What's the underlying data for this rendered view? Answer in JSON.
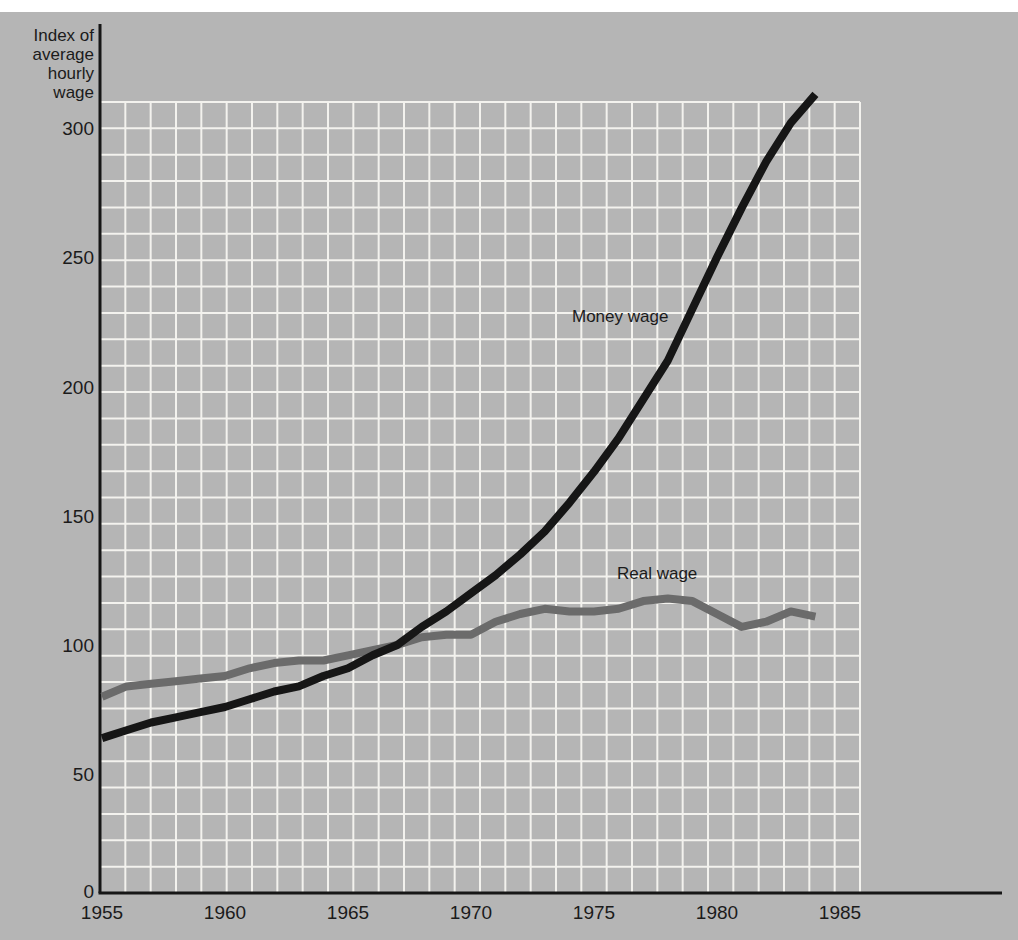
{
  "page": {
    "background_color": "#ffffff",
    "panel_color": "#b5b5b5"
  },
  "chart": {
    "y_axis_title_lines": [
      "Index of",
      "average",
      "hourly",
      "wage"
    ],
    "series_labels": {
      "money": "Money wage",
      "real": "Real wage"
    },
    "colors": {
      "plot_background": "#b5b5b5",
      "grid": "#f3f2ee",
      "axis": "#161616",
      "money_line": "#161616",
      "real_line": "#6b6b6b",
      "text": "#1b1b1b"
    }
  },
  "chart_data": {
    "type": "line",
    "title": "",
    "xlabel": "",
    "ylabel": "Index of average hourly wage",
    "xlim": [
      1955,
      1985
    ],
    "ylim": [
      0,
      320
    ],
    "grid": true,
    "legend_position": "inline-labels",
    "x_ticks": [
      1955,
      1960,
      1965,
      1970,
      1975,
      1980,
      1985
    ],
    "y_ticks": [
      0,
      50,
      100,
      150,
      200,
      250,
      300
    ],
    "x": [
      1955,
      1956,
      1957,
      1958,
      1959,
      1960,
      1961,
      1962,
      1963,
      1964,
      1965,
      1966,
      1967,
      1968,
      1969,
      1970,
      1971,
      1972,
      1973,
      1974,
      1975,
      1976,
      1977,
      1978,
      1979,
      1980,
      1981,
      1982,
      1983,
      1984
    ],
    "series": [
      {
        "name": "Money wage",
        "color": "#161616",
        "values": [
          64,
          67,
          70,
          72,
          74,
          76,
          79,
          82,
          84,
          88,
          91,
          96,
          100,
          107,
          113,
          120,
          127,
          135,
          144,
          155,
          167,
          180,
          195,
          210,
          230,
          250,
          269,
          287,
          302,
          313
        ]
      },
      {
        "name": "Real wage",
        "color": "#6b6b6b",
        "values": [
          80,
          84,
          85,
          86,
          87,
          88,
          91,
          93,
          94,
          94,
          96,
          98,
          100,
          103,
          104,
          104,
          109,
          112,
          114,
          113,
          113,
          114,
          117,
          118,
          117,
          112,
          107,
          109,
          113,
          111
        ]
      }
    ]
  }
}
